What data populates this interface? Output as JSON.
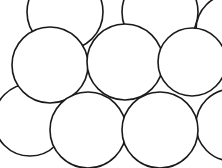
{
  "diagram": {
    "type": "circle-packing",
    "width": 222,
    "height": 168,
    "stroke": "#1a1a1a",
    "background": "#ffffff",
    "back_circles": [
      {
        "cx": 65,
        "cy": 12,
        "r": 38
      },
      {
        "cx": 160,
        "cy": 12,
        "r": 38
      },
      {
        "cx": 232,
        "cy": 30,
        "r": 36
      },
      {
        "cx": 30,
        "cy": 120,
        "r": 36
      },
      {
        "cx": 232,
        "cy": 125,
        "r": 36
      }
    ],
    "front_circles": [
      {
        "cx": 50,
        "cy": 65,
        "r": 38
      },
      {
        "cx": 125,
        "cy": 62,
        "r": 38
      },
      {
        "cx": 192,
        "cy": 62,
        "r": 34
      },
      {
        "cx": 88,
        "cy": 130,
        "r": 38
      },
      {
        "cx": 160,
        "cy": 130,
        "r": 38
      }
    ]
  }
}
